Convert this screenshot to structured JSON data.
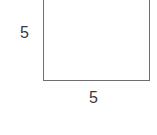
{
  "figure": {
    "shape": "square",
    "side_left_label": "5",
    "side_bottom_label": "5",
    "stroke_color": "#6e6e6e",
    "label_color": "#3a3a3a"
  }
}
